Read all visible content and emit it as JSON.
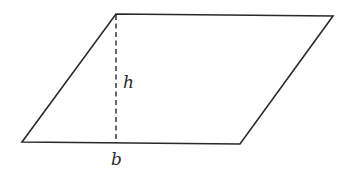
{
  "diagram": {
    "type": "parallelogram",
    "vertices": {
      "top_left": [
        116,
        14
      ],
      "top_right": [
        333,
        16
      ],
      "bottom_right": [
        240,
        144
      ],
      "bottom_left": [
        22,
        142
      ]
    },
    "height_line": {
      "x": 116,
      "y1": 14,
      "y2": 143,
      "style": "dashed"
    },
    "labels": {
      "height": "h",
      "base": "b"
    },
    "colors": {
      "stroke": "#2a2a2a",
      "background": "#ffffff"
    }
  }
}
